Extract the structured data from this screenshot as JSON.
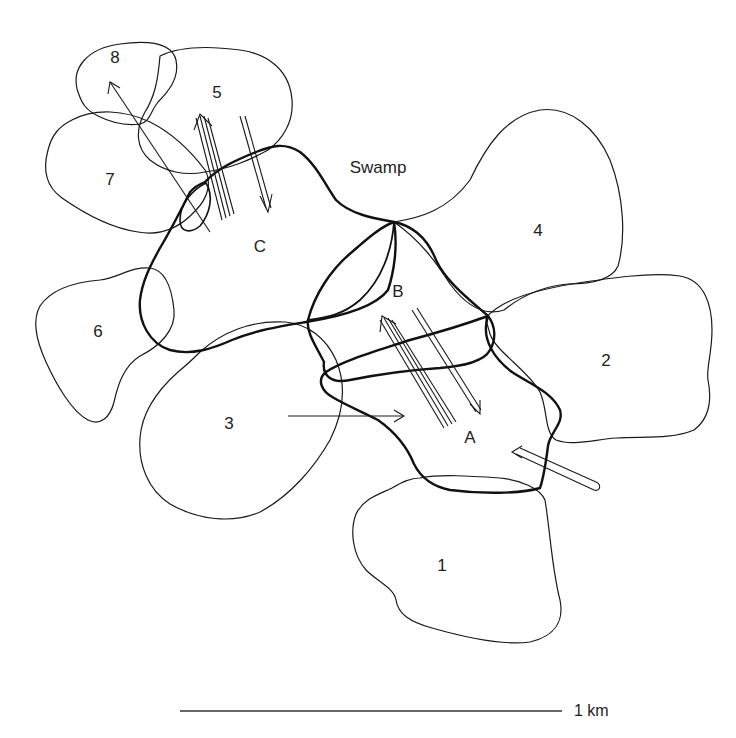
{
  "diagram": {
    "type": "territory-map",
    "region_label": "Swamp",
    "scale_bar": {
      "label": "1 km"
    },
    "territories": [
      {
        "id": "A",
        "label": "A",
        "style": "thick"
      },
      {
        "id": "B",
        "label": "B",
        "style": "thick"
      },
      {
        "id": "C",
        "label": "C",
        "style": "thick"
      }
    ],
    "home_ranges": [
      {
        "id": "1",
        "label": "1"
      },
      {
        "id": "2",
        "label": "2"
      },
      {
        "id": "3",
        "label": "3"
      },
      {
        "id": "4",
        "label": "4"
      },
      {
        "id": "5",
        "label": "5"
      },
      {
        "id": "6",
        "label": "6"
      },
      {
        "id": "7",
        "label": "7"
      },
      {
        "id": "8",
        "label": "8"
      }
    ],
    "movements": [
      {
        "from": "C",
        "to": "8",
        "lines": 1
      },
      {
        "from": "C",
        "to": "5",
        "lines": 4
      },
      {
        "from": "5",
        "to": "C",
        "lines": 2
      },
      {
        "from": "3",
        "to": "A",
        "lines": 1
      },
      {
        "from": "A",
        "to": "B",
        "lines": 4
      },
      {
        "from": "B",
        "to": "A",
        "lines": 2
      },
      {
        "from": "outside-southeast",
        "to": "A",
        "lines": 2
      }
    ]
  }
}
